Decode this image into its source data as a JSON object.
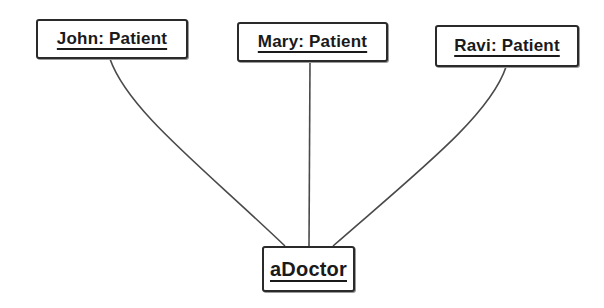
{
  "diagram": {
    "type": "UML object diagram",
    "objects": [
      {
        "id": "john",
        "label": "John: Patient",
        "x": 36,
        "y": 19,
        "w": 152,
        "h": 40
      },
      {
        "id": "mary",
        "label": "Mary: Patient",
        "x": 237,
        "y": 22,
        "w": 151,
        "h": 40
      },
      {
        "id": "ravi",
        "label": "Ravi: Patient",
        "x": 435,
        "y": 25,
        "w": 144,
        "h": 42
      },
      {
        "id": "doctor",
        "label": "aDoctor",
        "x": 262,
        "y": 246,
        "w": 93,
        "h": 46
      }
    ],
    "links": [
      {
        "from": "john",
        "to": "doctor",
        "path": "M110 59 C 128 110, 200 165, 285 246"
      },
      {
        "from": "mary",
        "to": "doctor",
        "path": "M310 62 L 309 246"
      },
      {
        "from": "ravi",
        "to": "doctor",
        "path": "M506 67 C 490 115, 420 170, 333 246"
      }
    ]
  }
}
